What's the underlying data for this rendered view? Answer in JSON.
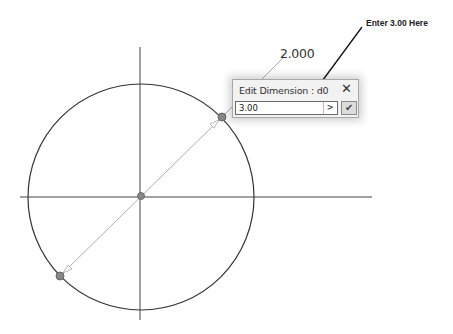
{
  "sketch": {
    "circle": {
      "cx": 141,
      "cy": 197,
      "r": 113
    },
    "axes": {
      "vertical": {
        "x": 140,
        "y1": 47,
        "y2": 320
      },
      "horizontal": {
        "y": 197,
        "x1": 20,
        "x2": 372
      }
    },
    "points": [
      {
        "name": "center-point",
        "x": 141,
        "y": 196
      },
      {
        "name": "upper-right-point",
        "x": 222,
        "y": 117
      },
      {
        "name": "lower-left-point",
        "x": 60,
        "y": 276
      }
    ],
    "dimension_value_label": "2.000"
  },
  "dialog": {
    "title": "Edit Dimension : d0",
    "close_glyph": "✕",
    "input_value": "3.00",
    "expand_glyph": ">",
    "ok_glyph": "✔"
  },
  "annotation": {
    "callout_text": "Enter 3.00 Here"
  },
  "colors": {
    "geometry": "#333333",
    "point_fill": "#7a7a7a",
    "dimension_line": "#8a8a8a"
  }
}
